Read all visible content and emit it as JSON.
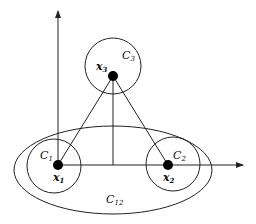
{
  "diagram": {
    "colors": {
      "stroke": "#222222",
      "point_fill": "#000000",
      "background": "#ffffff"
    },
    "points": [
      {
        "id": "x1",
        "label": "x",
        "subscript": "1"
      },
      {
        "id": "x2",
        "label": "x",
        "subscript": "2"
      },
      {
        "id": "x3",
        "label": "x",
        "subscript": "3"
      }
    ],
    "regions": [
      {
        "id": "C1",
        "label": "C",
        "subscript": "1"
      },
      {
        "id": "C2",
        "label": "C",
        "subscript": "2"
      },
      {
        "id": "C3",
        "label": "C",
        "subscript": "3"
      },
      {
        "id": "C12",
        "label": "C",
        "subscript": "12"
      }
    ],
    "axes": {
      "x_axis": "horizontal arrow",
      "y_axis": "vertical arrow"
    }
  }
}
